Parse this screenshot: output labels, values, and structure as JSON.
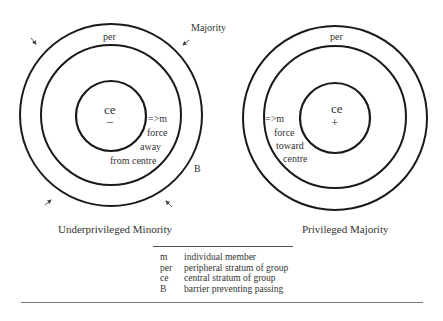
{
  "left_diagram": {
    "title": "Underprivileged Minority",
    "outer_label": "Majority",
    "periphery_label": "per",
    "centre_label": "ce",
    "centre_sign": "−",
    "member_label": "=>m",
    "force_lines": [
      "force",
      "away",
      "from centre"
    ],
    "barrier_label": "B",
    "arrows": "four arrows pointing inward from corners"
  },
  "right_diagram": {
    "title": "Privileged Majority",
    "periphery_label": "per",
    "centre_label": "ce",
    "centre_sign": "+",
    "member_label": "=>m",
    "force_lines": [
      "force",
      "toward",
      "centre"
    ]
  },
  "legend": {
    "items": [
      {
        "key": "m",
        "desc": "individual member"
      },
      {
        "key": "per",
        "desc": "peripheral stratum of group"
      },
      {
        "key": "ce",
        "desc": "central stratum of group"
      },
      {
        "key": "B",
        "desc": "barrier preventing passing"
      }
    ]
  },
  "colors": {
    "stroke": "#1a1a1a",
    "text": "#333333",
    "background": "#ffffff"
  }
}
